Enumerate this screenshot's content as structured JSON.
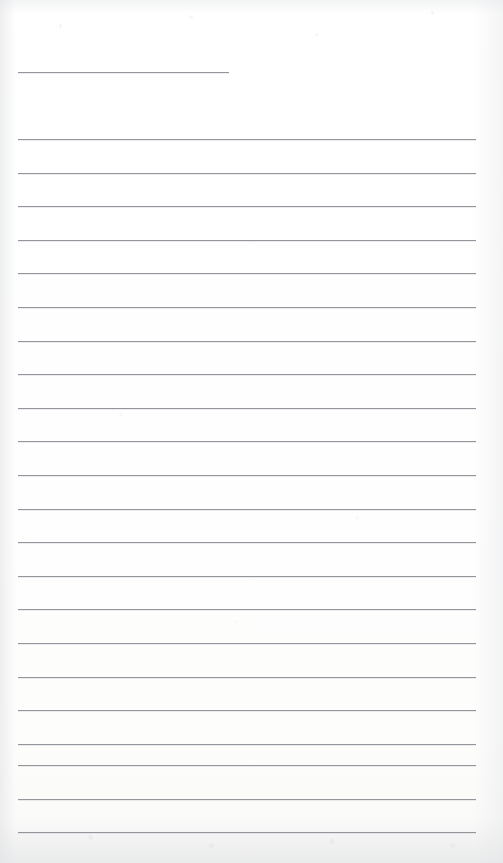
{
  "document": {
    "kind": "scanned-lined-notepaper",
    "title": "Blank ruled notepaper scan",
    "page_width": 503,
    "page_height": 863,
    "background_color": "#fefefe",
    "rule_color": "#8b8e93",
    "rule_thickness": 1,
    "text_content": "",
    "has_handwriting": false,
    "has_printed_text": false
  },
  "layout": {
    "left_margin_x": 18,
    "full_rule_right_x": 476,
    "title_rule_right_x": 229,
    "line_spacing": 33.6,
    "first_full_rule_y": 139,
    "last_full_rule_y": 832,
    "total_rules": 23,
    "full_width_rules": 22
  },
  "rules": [
    {
      "name": "title-rule",
      "y": 72,
      "x_start": 18,
      "x_end": 229,
      "variant": "short"
    },
    {
      "name": "rule-01",
      "y": 139,
      "x_start": 18,
      "x_end": 476,
      "variant": "full"
    },
    {
      "name": "rule-02",
      "y": 172.6,
      "x_start": 18,
      "x_end": 476,
      "variant": "full"
    },
    {
      "name": "rule-03",
      "y": 206.2,
      "x_start": 18,
      "x_end": 476,
      "variant": "full"
    },
    {
      "name": "rule-04",
      "y": 239.8,
      "x_start": 18,
      "x_end": 476,
      "variant": "full"
    },
    {
      "name": "rule-05",
      "y": 273.4,
      "x_start": 18,
      "x_end": 476,
      "variant": "full"
    },
    {
      "name": "rule-06",
      "y": 307.0,
      "x_start": 18,
      "x_end": 476,
      "variant": "full"
    },
    {
      "name": "rule-07",
      "y": 340.6,
      "x_start": 18,
      "x_end": 476,
      "variant": "full"
    },
    {
      "name": "rule-08",
      "y": 374.2,
      "x_start": 18,
      "x_end": 476,
      "variant": "full"
    },
    {
      "name": "rule-09",
      "y": 407.8,
      "x_start": 18,
      "x_end": 476,
      "variant": "full"
    },
    {
      "name": "rule-10",
      "y": 441.4,
      "x_start": 18,
      "x_end": 476,
      "variant": "full"
    },
    {
      "name": "rule-11",
      "y": 475.0,
      "x_start": 18,
      "x_end": 476,
      "variant": "full"
    },
    {
      "name": "rule-12",
      "y": 508.6,
      "x_start": 18,
      "x_end": 476,
      "variant": "full"
    },
    {
      "name": "rule-13",
      "y": 542.2,
      "x_start": 18,
      "x_end": 476,
      "variant": "full"
    },
    {
      "name": "rule-14",
      "y": 575.8,
      "x_start": 18,
      "x_end": 476,
      "variant": "full"
    },
    {
      "name": "rule-15",
      "y": 609.4,
      "x_start": 18,
      "x_end": 476,
      "variant": "full"
    },
    {
      "name": "rule-16",
      "y": 643.0,
      "x_start": 18,
      "x_end": 476,
      "variant": "full"
    },
    {
      "name": "rule-17",
      "y": 676.6,
      "x_start": 18,
      "x_end": 476,
      "variant": "full"
    },
    {
      "name": "rule-18",
      "y": 710.2,
      "x_start": 18,
      "x_end": 476,
      "variant": "full"
    },
    {
      "name": "rule-19",
      "y": 743.8,
      "x_start": 18,
      "x_end": 476,
      "variant": "full"
    },
    {
      "name": "rule-20",
      "y": 765.0,
      "x_start": 18,
      "x_end": 476,
      "variant": "full"
    },
    {
      "name": "rule-21",
      "y": 798.5,
      "x_start": 18,
      "x_end": 476,
      "variant": "full"
    },
    {
      "name": "rule-22",
      "y": 832.0,
      "x_start": 18,
      "x_end": 476,
      "variant": "full"
    }
  ]
}
